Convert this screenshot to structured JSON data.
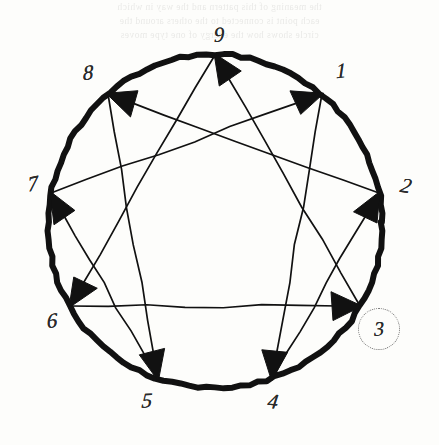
{
  "diagram": {
    "type": "enneagram",
    "style": "hand-drawn ink on paper",
    "stroke_color": "#111111",
    "paper_color": "#fdfdfb",
    "circle": {
      "center_x": 215,
      "center_y": 222,
      "radius": 167,
      "stroke_width": 6
    },
    "points": [
      {
        "id": "9",
        "label": "9",
        "angle_deg": 90,
        "px": 215,
        "py": 55,
        "label_x": 219,
        "label_y": 35
      },
      {
        "id": "1",
        "label": "1",
        "angle_deg": 50,
        "px": 322,
        "py": 94,
        "label_x": 341,
        "label_y": 71
      },
      {
        "id": "2",
        "label": "2",
        "angle_deg": 10,
        "px": 379,
        "py": 193,
        "label_x": 406,
        "label_y": 186
      },
      {
        "id": "3",
        "label": "3",
        "angle_deg": -30,
        "px": 360,
        "py": 306,
        "label_x": 379,
        "label_y": 329
      },
      {
        "id": "4",
        "label": "4",
        "angle_deg": -70,
        "px": 272,
        "py": 379,
        "label_x": 273,
        "label_y": 402
      },
      {
        "id": "5",
        "label": "5",
        "angle_deg": -110,
        "px": 158,
        "py": 379,
        "label_x": 147,
        "label_y": 401
      },
      {
        "id": "6",
        "label": "6",
        "angle_deg": -150,
        "px": 70,
        "py": 306,
        "label_x": 52,
        "label_y": 321
      },
      {
        "id": "7",
        "label": "7",
        "angle_deg": 170,
        "px": 51,
        "py": 193,
        "label_x": 33,
        "label_y": 184
      },
      {
        "id": "8",
        "label": "8",
        "angle_deg": 130,
        "px": 108,
        "py": 94,
        "label_x": 88,
        "label_y": 73
      }
    ],
    "arrows": [
      {
        "id": "9-to-6",
        "from": "9",
        "to": "6",
        "head_at": "6"
      },
      {
        "id": "6-to-3",
        "from": "6",
        "to": "3",
        "head_at": "3"
      },
      {
        "id": "3-to-9",
        "from": "3",
        "to": "9",
        "head_at": "9"
      },
      {
        "id": "1-to-4",
        "from": "1",
        "to": "4",
        "head_at": "4"
      },
      {
        "id": "4-to-2",
        "from": "4",
        "to": "2",
        "head_at": "2"
      },
      {
        "id": "2-to-8",
        "from": "2",
        "to": "8",
        "head_at": "8"
      },
      {
        "id": "8-to-5",
        "from": "8",
        "to": "5",
        "head_at": "5"
      },
      {
        "id": "5-to-7",
        "from": "5",
        "to": "7",
        "head_at": "7"
      },
      {
        "id": "7-to-1",
        "from": "7",
        "to": "1",
        "head_at": "1"
      }
    ],
    "annotation": {
      "highlighted_point": "3",
      "marker": "dotted-circle",
      "marker_x": 379,
      "marker_y": 329,
      "marker_color": "#6d6d6d"
    }
  },
  "bleed_through": {
    "visible": true,
    "description": "faint mirrored show-through text from reverse of page",
    "lines": [
      "the meaning of this pattern and the way in which",
      "each point is connected to the others around the",
      "circle shows how the energy of one type moves"
    ]
  }
}
